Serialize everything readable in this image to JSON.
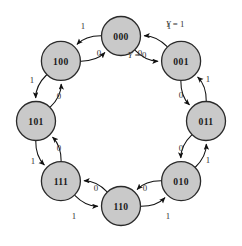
{
  "diagram": {
    "type": "state-transition-diagram",
    "title": "",
    "canvas": {
      "width": 242,
      "height": 246
    },
    "style": {
      "node_fill": "#c9c9c9",
      "node_stroke": "#2a2a2a",
      "edge_color": "#111111",
      "label_color": "#333333",
      "background": "#ffffff"
    },
    "layout": {
      "center_x": 121,
      "center_y": 121,
      "radius": 85,
      "node_radius": 19.5
    },
    "states": [
      {
        "id": "s000",
        "label": "000",
        "angle": -90,
        "cx": 121,
        "cy": 36
      },
      {
        "id": "s001",
        "label": "001",
        "angle": -45,
        "cx": 181.1,
        "cy": 60.9
      },
      {
        "id": "s011",
        "label": "011",
        "angle": 0,
        "cx": 206,
        "cy": 121
      },
      {
        "id": "s010",
        "label": "010",
        "angle": 45,
        "cx": 181.1,
        "cy": 181.1
      },
      {
        "id": "s110",
        "label": "110",
        "angle": 90,
        "cx": 121,
        "cy": 206
      },
      {
        "id": "s111",
        "label": "111",
        "angle": 135,
        "cx": 60.9,
        "cy": 181.1
      },
      {
        "id": "s101",
        "label": "101",
        "angle": 180,
        "cx": 36,
        "cy": 121
      },
      {
        "id": "s100",
        "label": "100",
        "angle": -135,
        "cx": 60.9,
        "cy": 60.9
      }
    ],
    "transitions": [
      {
        "from": "s000",
        "to": "s001",
        "input": "1",
        "label_x": 169,
        "label_y": 26,
        "bow": 14
      },
      {
        "from": "s001",
        "to": "s000",
        "input": "0",
        "label_x": 140,
        "label_y": 53,
        "bow": 14
      },
      {
        "from": "s001",
        "to": "s011",
        "input": "1",
        "label_x": 208,
        "label_y": 79,
        "bow": 14
      },
      {
        "from": "s011",
        "to": "s001",
        "input": "0",
        "label_x": 181,
        "label_y": 95,
        "bow": 14
      },
      {
        "from": "s011",
        "to": "s010",
        "input": "1",
        "label_x": 208,
        "label_y": 160,
        "bow": 14
      },
      {
        "from": "s010",
        "to": "s011",
        "input": "0",
        "label_x": 181,
        "label_y": 148,
        "bow": 14
      },
      {
        "from": "s010",
        "to": "s110",
        "input": "1",
        "label_x": 168,
        "label_y": 216,
        "bow": 14
      },
      {
        "from": "s110",
        "to": "s010",
        "input": "0",
        "label_x": 145,
        "label_y": 188,
        "bow": 14
      },
      {
        "from": "s110",
        "to": "s111",
        "input": "1",
        "label_x": 74,
        "label_y": 216,
        "bow": 14
      },
      {
        "from": "s111",
        "to": "s110",
        "input": "0",
        "label_x": 96,
        "label_y": 188,
        "bow": 14
      },
      {
        "from": "s111",
        "to": "s101",
        "input": "1",
        "label_x": 33,
        "label_y": 161,
        "bow": 14
      },
      {
        "from": "s101",
        "to": "s111",
        "input": "0",
        "label_x": 59,
        "label_y": 148,
        "bow": 14
      },
      {
        "from": "s101",
        "to": "s100",
        "input": "1",
        "label_x": 32,
        "label_y": 80,
        "bow": 14
      },
      {
        "from": "s100",
        "to": "s101",
        "input": "0",
        "label_x": 59,
        "label_y": 96,
        "bow": 14
      },
      {
        "from": "s100",
        "to": "s000",
        "input": "1",
        "label_x": 83,
        "label_y": 26,
        "bow": 14
      },
      {
        "from": "s000",
        "to": "s100",
        "input": "0",
        "label_x": 99,
        "label_y": 53,
        "bow": 14
      }
    ],
    "output_annotations": [
      {
        "id": "y-eq-1",
        "variable": "Y",
        "equals": "=",
        "value": "1",
        "x": 175,
        "y": 24
      },
      {
        "id": "y-eq-0",
        "variable": "Y",
        "equals": "=",
        "value": "0",
        "x": 137,
        "y": 55
      }
    ]
  }
}
